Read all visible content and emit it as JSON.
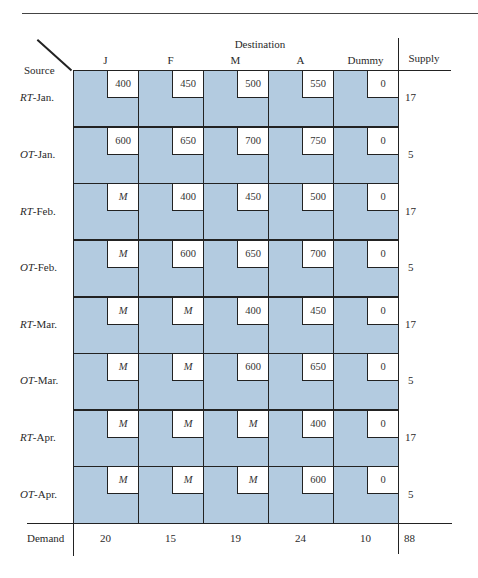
{
  "table": {
    "destination_title": "Destination",
    "source_header": "Source",
    "supply_header": "Supply",
    "demand_label": "Demand",
    "columns": [
      "J",
      "F",
      "M",
      "A",
      "Dummy"
    ],
    "rows": [
      {
        "prefix": "RT",
        "suffix": "-Jan.",
        "costs": [
          "400",
          "450",
          "500",
          "550",
          "0"
        ],
        "supply": "17"
      },
      {
        "prefix": "OT",
        "suffix": "-Jan.",
        "costs": [
          "600",
          "650",
          "700",
          "750",
          "0"
        ],
        "supply": "5"
      },
      {
        "prefix": "RT",
        "suffix": "-Feb.",
        "costs": [
          "M",
          "400",
          "450",
          "500",
          "0"
        ],
        "supply": "17"
      },
      {
        "prefix": "OT",
        "suffix": "-Feb.",
        "costs": [
          "M",
          "600",
          "650",
          "700",
          "0"
        ],
        "supply": "5"
      },
      {
        "prefix": "RT",
        "suffix": "-Mar.",
        "costs": [
          "M",
          "M",
          "400",
          "450",
          "0"
        ],
        "supply": "17"
      },
      {
        "prefix": "OT",
        "suffix": "-Mar.",
        "costs": [
          "M",
          "M",
          "600",
          "650",
          "0"
        ],
        "supply": "5"
      },
      {
        "prefix": "RT",
        "suffix": "-Apr.",
        "costs": [
          "M",
          "M",
          "M",
          "400",
          "0"
        ],
        "supply": "17"
      },
      {
        "prefix": "OT",
        "suffix": "-Apr.",
        "costs": [
          "M",
          "M",
          "M",
          "600",
          "0"
        ],
        "supply": "5"
      }
    ],
    "demand": [
      "20",
      "15",
      "19",
      "24",
      "10"
    ],
    "total": "88"
  },
  "colors": {
    "cell_background": "#b3cbe0",
    "cost_box_background": "#ffffff",
    "line": "#222222"
  }
}
